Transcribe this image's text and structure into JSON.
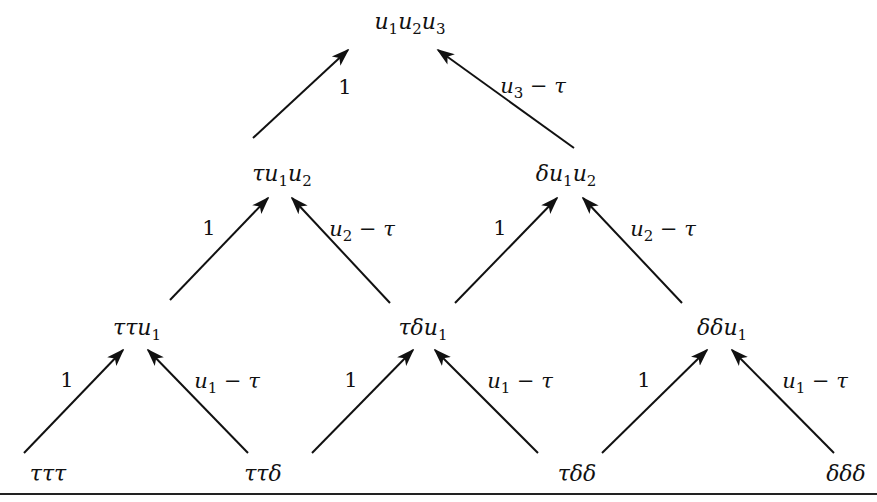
{
  "diagram": {
    "type": "tree",
    "direction": "bottom-to-top",
    "colors": {
      "ink": "#111111",
      "background": "#ffffff"
    },
    "nodes": [
      {
        "id": "n_top",
        "level": 3,
        "base": [
          "u",
          "1",
          "u",
          "2",
          "u",
          "3"
        ],
        "text": "u1u2u3",
        "x": 410,
        "y": 25
      },
      {
        "id": "n_tu1u2",
        "level": 2,
        "text": "τu1u2",
        "x": 282,
        "y": 178
      },
      {
        "id": "n_du1u2",
        "level": 2,
        "text": "δu1u2",
        "x": 566,
        "y": 178
      },
      {
        "id": "n_ttu1",
        "level": 1,
        "text": "ττu1",
        "x": 137,
        "y": 332
      },
      {
        "id": "n_tdu1",
        "level": 1,
        "text": "τδu1",
        "x": 423,
        "y": 332
      },
      {
        "id": "n_ddu1",
        "level": 1,
        "text": "δδu1",
        "x": 722,
        "y": 332
      },
      {
        "id": "n_ttt",
        "level": 0,
        "text": "τττ",
        "x": 48,
        "y": 476
      },
      {
        "id": "n_ttd",
        "level": 0,
        "text": "ττδ",
        "x": 263,
        "y": 476
      },
      {
        "id": "n_tdd",
        "level": 0,
        "text": "τδδ",
        "x": 577,
        "y": 476
      },
      {
        "id": "n_ddd",
        "level": 0,
        "text": "δδδ",
        "x": 846,
        "y": 476
      }
    ],
    "labels": {
      "top": {
        "pre": "",
        "s1": "u",
        "i1": "1",
        "s2": "u",
        "i2": "2",
        "s3": "u",
        "i3": "3"
      },
      "tu1u2": {
        "pre": "τ",
        "s1": "u",
        "i1": "1",
        "s2": "u",
        "i2": "2"
      },
      "du1u2": {
        "pre": "δ",
        "s1": "u",
        "i1": "1",
        "s2": "u",
        "i2": "2"
      },
      "ttu1": {
        "pre": "ττ",
        "s1": "u",
        "i1": "1"
      },
      "tdu1": {
        "pre": "τδ",
        "s1": "u",
        "i1": "1"
      },
      "ddu1": {
        "pre": "δδ",
        "s1": "u",
        "i1": "1"
      },
      "ttt": "τττ",
      "ttd": "ττδ",
      "tdd": "τδδ",
      "ddd": "δδδ"
    },
    "edges": [
      {
        "from": "n_tu1u2",
        "to": "n_top",
        "label": "1"
      },
      {
        "from": "n_du1u2",
        "to": "n_top",
        "label": "u3 − τ"
      },
      {
        "from": "n_ttu1",
        "to": "n_tu1u2",
        "label": "1"
      },
      {
        "from": "n_tdu1",
        "to": "n_tu1u2",
        "label": "u2 − τ"
      },
      {
        "from": "n_tdu1",
        "to": "n_du1u2",
        "label": "1"
      },
      {
        "from": "n_ddu1",
        "to": "n_du1u2",
        "label": "u2 − τ"
      },
      {
        "from": "n_ttt",
        "to": "n_ttu1",
        "label": "1"
      },
      {
        "from": "n_ttd",
        "to": "n_ttu1",
        "label": "u1 − τ"
      },
      {
        "from": "n_tdd",
        "to": "n_tdu1",
        "label": "1"
      },
      {
        "from": "n_tdd",
        "to": "n_tdu1",
        "label": "u1 − τ"
      },
      {
        "from": "n_tdd",
        "to": "n_ddu1",
        "label": "1"
      },
      {
        "from": "n_ddd",
        "to": "n_ddu1",
        "label": "u1 − τ"
      }
    ],
    "edge_labels": {
      "one": "1",
      "minus_tau": " − τ",
      "u": "u",
      "i1": "1",
      "i2": "2",
      "i3": "3"
    }
  }
}
